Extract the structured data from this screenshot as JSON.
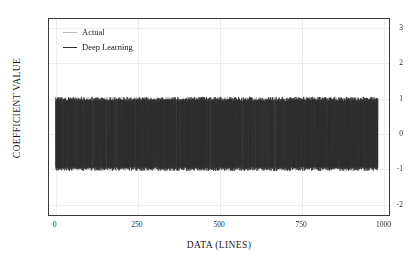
{
  "chart_data": {
    "type": "line",
    "title": "",
    "xlabel": "DATA (LINES)",
    "ylabel": "COEFFICIENT VALUE",
    "xlim": [
      -20,
      1020
    ],
    "ylim": [
      -2.35,
      3.25
    ],
    "xticks": [
      0,
      250,
      500,
      750,
      1000
    ],
    "xticklabels": [
      "0",
      "250",
      "500",
      "750",
      "1000"
    ],
    "yticks": [
      3,
      2,
      1,
      0,
      -1,
      -2
    ],
    "yticklabels": [
      "3",
      "2",
      "1",
      "0",
      "-1",
      "-2"
    ],
    "grid": true,
    "legend_position": "upper left",
    "series": [
      {
        "name": "Actual",
        "color": "#b9b9b9",
        "linewidth": 0.7,
        "description": "Rapidly oscillating coefficient signal alternating between approximately +1 and -1 across all 1000 data lines",
        "x_range": [
          0,
          980
        ],
        "y_min": -1.05,
        "y_max": 1.05,
        "n_points": 1000
      },
      {
        "name": "Deep Learning",
        "color": "#2e2e2e",
        "linewidth": 0.7,
        "description": "Predicted coefficient signal closely tracking the actual signal, oscillating between approximately +1 and -1",
        "x_range": [
          0,
          980
        ],
        "y_min": -1.05,
        "y_max": 1.05,
        "n_points": 1000
      }
    ]
  },
  "axes": {
    "ylabel": "COEFFICIENT VALUE",
    "xlabel": "DATA (LINES)",
    "yticklabels": [
      "3",
      "2",
      "1",
      "0",
      "-1",
      "-2"
    ],
    "xticklabels": [
      "0",
      "250",
      "500",
      "750",
      "1000"
    ]
  },
  "legend": {
    "items": [
      {
        "label": "Actual",
        "color": "#b9b9b9"
      },
      {
        "label": "Deep Learning",
        "color": "#2e2e2e"
      }
    ]
  }
}
